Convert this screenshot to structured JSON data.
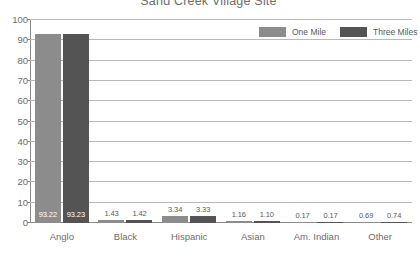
{
  "chart_data": {
    "type": "bar",
    "title": "Sand Creek Village Site",
    "xlabel": "",
    "ylabel": "",
    "ylim": [
      0,
      100
    ],
    "yticks": [
      0,
      10,
      20,
      30,
      40,
      50,
      60,
      70,
      80,
      90,
      100
    ],
    "grid": true,
    "legend_position": "top-right",
    "categories": [
      "Anglo",
      "Black",
      "Hispanic",
      "Asian",
      "Am. Indian",
      "Other"
    ],
    "series": [
      {
        "name": "One Mile",
        "color": "#8c8c8c",
        "values": [
          93.22,
          1.43,
          3.34,
          1.16,
          0.17,
          0.69
        ],
        "labels": [
          "93.22",
          "1.43",
          "3.34",
          "1.16",
          "0.17",
          "0.69"
        ]
      },
      {
        "name": "Three Miles",
        "color": "#545454",
        "values": [
          93.23,
          1.42,
          3.33,
          1.1,
          0.17,
          0.74
        ],
        "labels": [
          "93.23",
          "1.42",
          "3.33",
          "1.10",
          "0.17",
          "0.74"
        ]
      }
    ]
  },
  "axis": {
    "y_tick_labels": [
      "100",
      "90",
      "80",
      "70",
      "60",
      "50",
      "40",
      "30",
      "20",
      "10",
      "0"
    ]
  },
  "legend": {
    "items": [
      {
        "label": "One Mile",
        "color": "#8c8c8c"
      },
      {
        "label": "Three Miles",
        "color": "#545454"
      }
    ]
  }
}
